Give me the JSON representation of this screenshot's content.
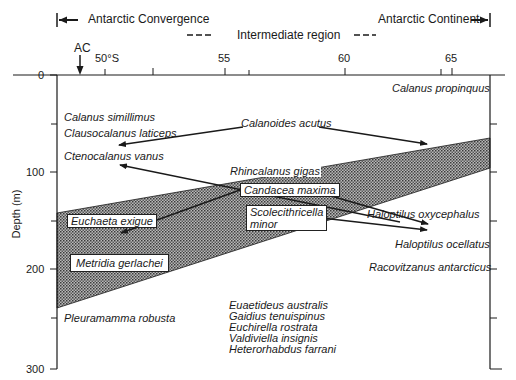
{
  "header": {
    "left_region": "Antarctic Convergence",
    "right_region": "Antarctic Continent",
    "middle_region": "Intermediate region",
    "ac_marker": "AC"
  },
  "axes": {
    "x_ticks": [
      "50°S",
      "55",
      "60",
      "65"
    ],
    "y_ticks": [
      "0",
      "100",
      "200",
      "300"
    ],
    "y_label": "Depth (m)"
  },
  "species": {
    "calanus_propinquus": "Calanus propinquus",
    "calanus_simillimus": "Calanus simillimus",
    "clausocalanus_laticeps": "Clausocalanus laticeps",
    "calanoides_acutus": "Calanoides acutus",
    "ctenocalanus_vanus": "Ctenocalanus vanus",
    "rhincalanus_gigas": "Rhincalanus gigas",
    "candacea_maxima": "Candacea maxima",
    "scolecithricella_line1": "Scolecithricella",
    "scolecithricella_line2": "minor",
    "euchaeta_exigue": "Euchaeta exigue",
    "haloptilus_oxycephalus": "Haloptilus oxycephalus",
    "haloptilus_ocellatus": "Haloptilus ocellatus",
    "metridia_gerlachei": "Metridia gerlachei",
    "racovitzanus_antarcticus": "Racovitzanus antarcticus",
    "pleuramamma_robusta": "Pleuramamma robusta",
    "deep_group": [
      "Euaetideus australis",
      "Gaidius tenuispinus",
      "Euchirella rostrata",
      "Valdiviella insignis",
      "Heterorhabdus farrani"
    ]
  },
  "colors": {
    "ink": "#1a1a1a",
    "band_fill": "#8a8a8a",
    "background": "#ffffff"
  }
}
